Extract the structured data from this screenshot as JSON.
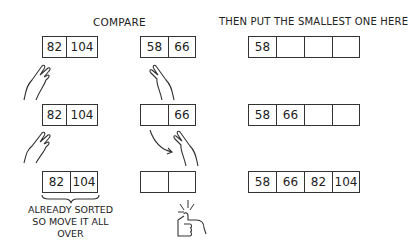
{
  "headings": {
    "compare": "COMPARE",
    "destination": "THEN PUT THE SMALLEST ONE HERE"
  },
  "rows": [
    {
      "left": [
        "82",
        "104"
      ],
      "middle": [
        "58",
        "66"
      ],
      "result": [
        "58",
        "",
        "",
        ""
      ]
    },
    {
      "left": [
        "82",
        "104"
      ],
      "middle": [
        "",
        "66"
      ],
      "result": [
        "58",
        "66",
        "",
        ""
      ]
    },
    {
      "left": [
        "82",
        "104"
      ],
      "middle": [
        "",
        ""
      ],
      "result": [
        "58",
        "66",
        "82",
        "104"
      ]
    }
  ],
  "note": {
    "line1": "ALREADY SORTED",
    "line2": "SO MOVE IT ALL OVER"
  },
  "icons": [
    "hand-pointing-icon",
    "curved-arrow-icon",
    "thumbs-up-icon",
    "brace-icon"
  ]
}
